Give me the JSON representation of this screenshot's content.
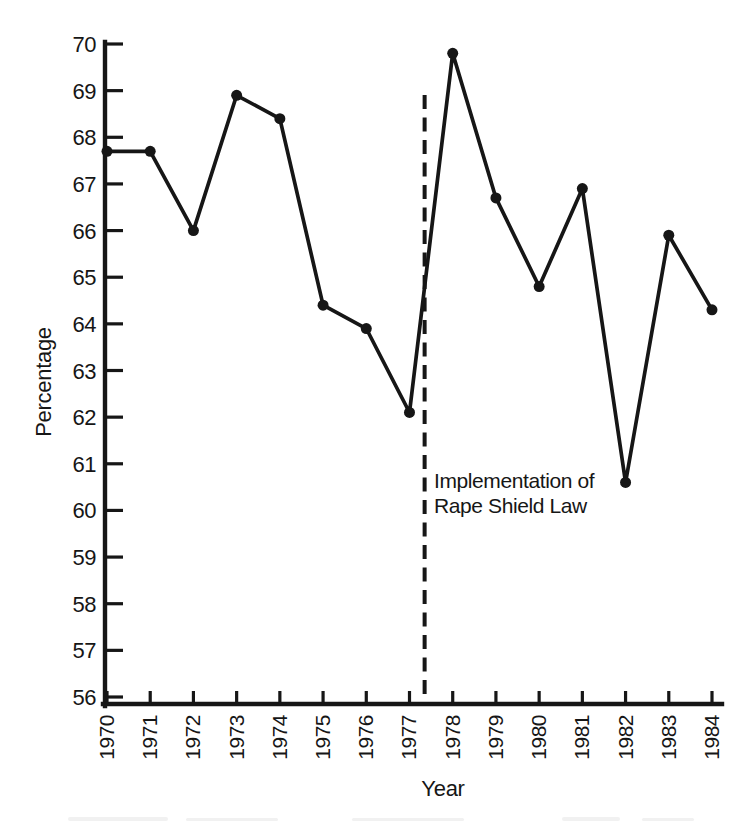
{
  "figure": {
    "background": "#ffffff",
    "ink_color": "#161616"
  },
  "chart_data": {
    "type": "line",
    "xlabel": "Year",
    "ylabel": "Percentage",
    "x": [
      1970,
      1971,
      1972,
      1973,
      1974,
      1975,
      1976,
      1977,
      1978,
      1979,
      1980,
      1981,
      1982,
      1983,
      1984
    ],
    "values": [
      67.7,
      67.7,
      66.0,
      68.9,
      68.4,
      64.4,
      63.9,
      62.1,
      69.8,
      66.7,
      64.8,
      66.9,
      60.6,
      65.9,
      64.3
    ],
    "xlim": [
      1970,
      1984
    ],
    "ylim": [
      56,
      70
    ],
    "ytick_step": 1,
    "grid": false,
    "legend": false,
    "marker": "filled-circle",
    "annotation": {
      "line1": "Implementation of",
      "line2": "Rape Shield Law",
      "x_position": 1977.35,
      "style": "vertical-dashed-line"
    }
  }
}
